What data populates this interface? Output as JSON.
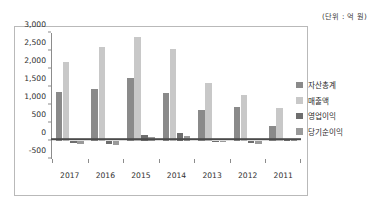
{
  "unit_note": "(단위 : 억 원)",
  "chart_data": {
    "type": "bar",
    "title": "",
    "subtitle": "",
    "xlabel": "",
    "ylabel": "",
    "unit_note": "(단위 : 억 원)",
    "grid": false,
    "legend_position": "right",
    "ylim": [
      -500,
      3000
    ],
    "ytick_step": 500,
    "yticks": [
      3000,
      2500,
      2000,
      1500,
      1000,
      500,
      0,
      -500
    ],
    "ytick_labels": [
      "3,000",
      "2,500",
      "2,000",
      "1,500",
      "1,000",
      "500",
      "0",
      "-500"
    ],
    "categories": [
      "2017",
      "2016",
      "2015",
      "2014",
      "2013",
      "2012",
      "2011"
    ],
    "series": [
      {
        "name": "자산총계",
        "color": "#8a8a8a",
        "values": [
          1370,
          1450,
          1760,
          1320,
          870,
          935,
          415
        ]
      },
      {
        "name": "매출액",
        "color": "#c8c8c8",
        "values": [
          2200,
          2610,
          2890,
          2560,
          1620,
          1290,
          930
        ]
      },
      {
        "name": "영업이익",
        "color": "#6e6e6e",
        "values": [
          -60,
          -90,
          155,
          220,
          -20,
          -50,
          35
        ]
      },
      {
        "name": "당기순이익",
        "color": "#9a9a9a",
        "values": [
          -75,
          -120,
          110,
          145,
          -30,
          -90,
          30
        ]
      }
    ]
  },
  "colors": {
    "series_1": "#8a8a8a",
    "series_2": "#c8c8c8",
    "series_3": "#6e6e6e",
    "series_4": "#9a9a9a",
    "axis": "#8c8c8c",
    "zero_line": "#4a4a4a",
    "frame": "#b9b9b9",
    "text": "#2f2f2f",
    "background": "#ffffff"
  }
}
